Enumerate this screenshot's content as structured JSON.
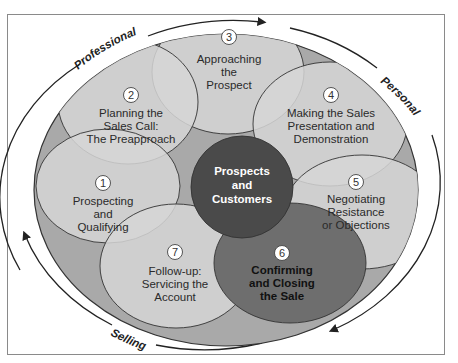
{
  "diagram": {
    "center": {
      "lines": [
        "Prospects",
        "and",
        "Customers"
      ]
    },
    "steps": [
      {
        "number": "1",
        "lines": [
          "Prospecting",
          "and",
          "Qualifying"
        ]
      },
      {
        "number": "2",
        "lines": [
          "Planning the",
          "Sales Call:",
          "The Preapproach"
        ]
      },
      {
        "number": "3",
        "lines": [
          "Approaching",
          "the",
          "Prospect"
        ]
      },
      {
        "number": "4",
        "lines": [
          "Making the Sales",
          "Presentation and",
          "Demonstration"
        ]
      },
      {
        "number": "5",
        "lines": [
          "Negotiating",
          "Resistance",
          "or Objections"
        ]
      },
      {
        "number": "6",
        "lines": [
          "Confirming",
          "and Closing",
          "the Sale"
        ]
      },
      {
        "number": "7",
        "lines": [
          "Follow-up:",
          "Servicing the",
          "Account"
        ]
      }
    ],
    "arc_labels": {
      "top_left": "Professional",
      "right": "Personal",
      "bottom": "Selling"
    },
    "colors": {
      "outer_ellipse": "#a9a9a9",
      "step_fill": "#d6d6d6",
      "center_fill": "#4a4a4a",
      "closing_fill": "#6e6e6e",
      "frame": "#8a8a8a"
    }
  }
}
